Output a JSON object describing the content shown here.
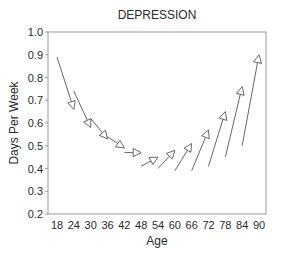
{
  "chart_data": {
    "type": "line",
    "subtype": "arrow-segments",
    "title": "DEPRESSION",
    "xlabel": "Age",
    "ylabel": "Days Per Week",
    "x_ticks": [
      18,
      24,
      30,
      36,
      42,
      48,
      54,
      60,
      66,
      72,
      78,
      84,
      90
    ],
    "y_ticks": [
      0.2,
      0.3,
      0.4,
      0.5,
      0.6,
      0.7,
      0.8,
      0.9,
      1.0
    ],
    "y_tick_labels": [
      "0.2",
      "0.3",
      "0.4",
      "0.5",
      "0.6",
      "0.7",
      "0.8",
      "0.9",
      "1.0"
    ],
    "ylim": [
      0.2,
      1.0
    ],
    "xlim": [
      15,
      93
    ],
    "grid": false,
    "legend": null,
    "segments": [
      {
        "x_start": 18,
        "y_start": 0.89,
        "x_end": 24,
        "y_end": 0.66
      },
      {
        "x_start": 24,
        "y_start": 0.74,
        "x_end": 30,
        "y_end": 0.58
      },
      {
        "x_start": 30,
        "y_start": 0.62,
        "x_end": 36,
        "y_end": 0.53
      },
      {
        "x_start": 36,
        "y_start": 0.54,
        "x_end": 42,
        "y_end": 0.49
      },
      {
        "x_start": 42,
        "y_start": 0.47,
        "x_end": 48,
        "y_end": 0.47
      },
      {
        "x_start": 48,
        "y_start": 0.41,
        "x_end": 54,
        "y_end": 0.45
      },
      {
        "x_start": 54,
        "y_start": 0.4,
        "x_end": 60,
        "y_end": 0.48
      },
      {
        "x_start": 60,
        "y_start": 0.39,
        "x_end": 66,
        "y_end": 0.51
      },
      {
        "x_start": 66,
        "y_start": 0.39,
        "x_end": 72,
        "y_end": 0.57
      },
      {
        "x_start": 72,
        "y_start": 0.41,
        "x_end": 78,
        "y_end": 0.65
      },
      {
        "x_start": 78,
        "y_start": 0.45,
        "x_end": 84,
        "y_end": 0.76
      },
      {
        "x_start": 84,
        "y_start": 0.5,
        "x_end": 90,
        "y_end": 0.9
      }
    ],
    "colors": {
      "axis": "#9a9a9a",
      "arrow": "#555555",
      "text": "#2a2a2a"
    }
  }
}
